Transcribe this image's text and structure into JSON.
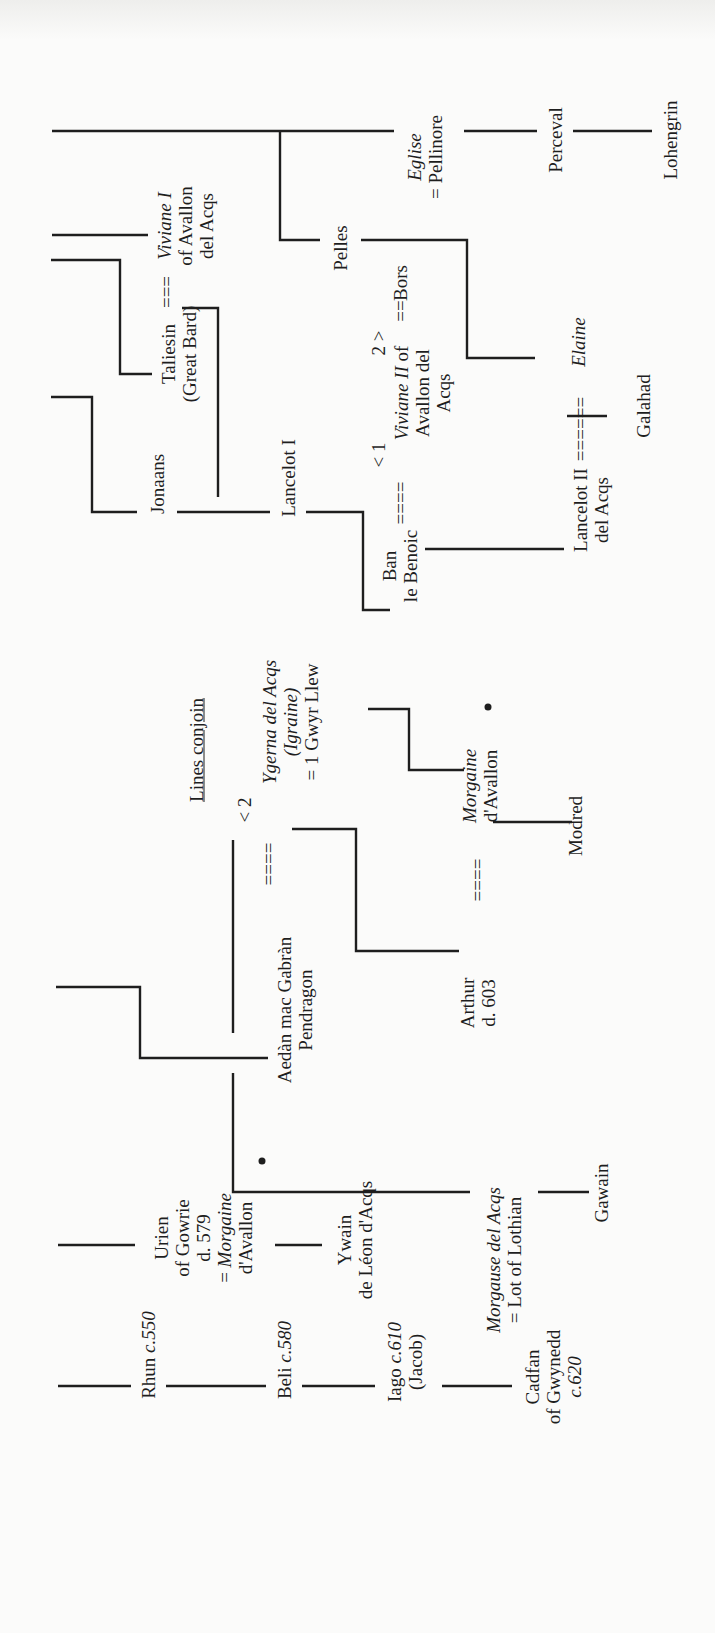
{
  "diagram": {
    "type": "genealogy-tree",
    "orientation": "rotated-90-ccw",
    "heading_note": "Lines conjoin",
    "people": {
      "rhun": {
        "name": "Rhun",
        "date": "c.550"
      },
      "beli": {
        "name": "Beli",
        "date": "c.580"
      },
      "iago": {
        "name": "Iago",
        "date": "c.610",
        "alias": "(Jacob)"
      },
      "cadfan": {
        "line1": "Cadfan",
        "line2": "of Gwynedd",
        "line3": "c.620"
      },
      "urien": {
        "line1": "Urien",
        "line2": "of Gowrie",
        "line3": "d. 579",
        "line4_prefix": "= ",
        "line4_italic": "Morgaine",
        "line5": "d'Avallon"
      },
      "ywain": {
        "line1": "Ywain",
        "line2": "de Léon d'Acqs"
      },
      "morgause": {
        "line1_italic": "Morgause del Acqs",
        "line2": "= Lot of Lothian"
      },
      "gawain": {
        "name": "Gawain"
      },
      "aedan": {
        "line1": "Aedàn mac Gabràn",
        "line2": "Pendragon"
      },
      "marriage_aedan_ygerna": "====",
      "ygerna_order": "< 2",
      "ygerna": {
        "line1_italic": "Ygerna del Acqs",
        "line2_italic": "(Igraine)",
        "line3": "= 1 Gwyr Llew"
      },
      "arthur": {
        "line1": "Arthur",
        "line2": "d. 603"
      },
      "marriage_arthur_morgaine": "====",
      "morgaine": {
        "line1_italic": "Morgaine",
        "line2": "d'Avallon"
      },
      "modred": {
        "name": "Modred"
      },
      "jonaans": {
        "name": "Jonaans"
      },
      "lancelot1": {
        "name": "Lancelot I"
      },
      "ban": {
        "line1": "Ban",
        "line2": "le Benoic"
      },
      "marriage_ban_viviane2": "====",
      "viviane2_order_1": "< 1",
      "viviane2_order_2": "2 >",
      "viviane2": {
        "line1_italic": "Viviane II",
        "line1_suffix": " of",
        "line2": "Avallon del",
        "line3": "Acqs"
      },
      "marriage_viviane2_bors": "==",
      "bors": {
        "name": "Bors"
      },
      "lancelot2": {
        "line1": "Lancelot II",
        "line2": "del Acqs"
      },
      "marriage_lancelot2_elaine": "======",
      "elaine": {
        "name_italic": "Elaine"
      },
      "galahad": {
        "name": "Galahad"
      },
      "taliesin": {
        "line1": "Taliesin",
        "line2": "(Great Bard)"
      },
      "marriage_taliesin_viviane1": "===",
      "viviane1": {
        "line1_italic": "Viviane I",
        "line2": "of Avallon",
        "line3": "del Acqs"
      },
      "pelles": {
        "name": "Pelles"
      },
      "eglise": {
        "line1_italic": "Eglise",
        "line2": "= Pellinore"
      },
      "perceval": {
        "name": "Perceval"
      },
      "lohengrin": {
        "name": "Lohengrin"
      }
    },
    "markers": {
      "bullet": "•"
    }
  }
}
